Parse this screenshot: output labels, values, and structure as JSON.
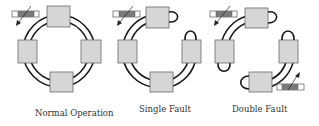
{
  "panels": [
    {
      "id": "normal",
      "label": "Normal Operation",
      "nodes": 4,
      "links": [
        "top-left",
        "top-right",
        "left-bottom",
        "right-bottom"
      ],
      "loopbacks": []
    },
    {
      "id": "single",
      "label": "Single Fault",
      "nodes": 4,
      "links": [
        "top-left",
        "left-bottom",
        "right-bottom"
      ],
      "loopbacks": [
        "top-node-right",
        "right-node-top"
      ]
    },
    {
      "id": "double",
      "label": "Double Fault",
      "nodes": 4,
      "links": [
        "top-left",
        "right-bottom"
      ],
      "loopbacks": [
        "top-node-right",
        "left-node-bottom",
        "right-node-top",
        "bottom-node-left"
      ]
    }
  ],
  "colors": {
    "node_fill": "#d6d6d6",
    "ring_stroke": "#1a1a1a",
    "cable_fill": "#7a7a7a"
  },
  "icons": {
    "cable": "fiber-cable-icon",
    "arrow": "arrow-icon"
  }
}
